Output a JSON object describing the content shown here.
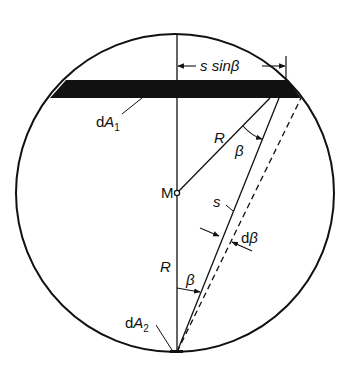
{
  "diagram": {
    "type": "geometry",
    "colors": {
      "stroke": "#111111",
      "background": "#ffffff"
    },
    "labels": {
      "dimension": "s sinβ",
      "dA1": "dA",
      "dA1_sub": "1",
      "dA2": "dA",
      "dA2_sub": "2",
      "center": "M",
      "radius_upper": "R",
      "radius_lower": "R",
      "beta_upper": "β",
      "beta_lower": "β",
      "s": "s",
      "dbeta": "dβ"
    }
  }
}
